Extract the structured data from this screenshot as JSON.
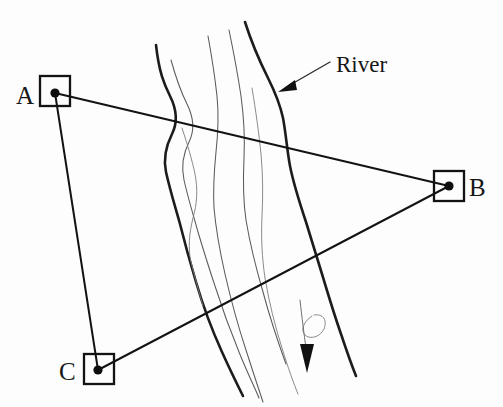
{
  "figure": {
    "type": "surveying-diagram",
    "background_color": "#fdfdfd",
    "ink_color": "#131313",
    "width": 503,
    "height": 407
  },
  "stations": [
    {
      "id": "A",
      "label": "A",
      "label_x": 16,
      "label_y": 104,
      "point_x": 55,
      "point_y": 93,
      "box_x": 40,
      "box_y": 76,
      "box_w": 30,
      "box_h": 30
    },
    {
      "id": "B",
      "label": "B",
      "label_x": 469,
      "label_y": 196,
      "point_x": 449,
      "point_y": 186,
      "box_x": 434,
      "box_y": 171,
      "box_w": 30,
      "box_h": 30
    },
    {
      "id": "C",
      "label": "C",
      "label_x": 59,
      "label_y": 380,
      "point_x": 98,
      "point_y": 370,
      "box_x": 84,
      "box_y": 354,
      "box_w": 30,
      "box_h": 30
    }
  ],
  "sight_lines": [
    {
      "name": "line-a-b",
      "from": "A",
      "to": "B"
    },
    {
      "name": "line-a-c",
      "from": "A",
      "to": "C"
    },
    {
      "name": "line-c-b",
      "from": "C",
      "to": "B"
    }
  ],
  "annotations": {
    "river_label": "River",
    "river_leader_from_x": 330,
    "river_leader_from_y": 62,
    "river_leader_to_x": 279,
    "river_leader_to_y": 92
  },
  "river": {
    "flow_direction": "downstream-south",
    "left_bank_path": "M 156 45 C 159 72, 164 84, 170 96 C 177 110, 178 122, 172 134 C 166 146, 163 158, 166 172 C 170 190, 175 206, 180 224 C 185 244, 190 262, 196 282 C 203 306, 212 330, 222 352 C 231 372, 238 386, 243 396",
    "right_bank_path": "M 245 22 C 252 44, 260 62, 268 78 C 275 92, 280 104, 283 118 C 286 134, 287 150, 290 166 C 294 186, 300 204, 306 222 C 312 242, 317 258, 322 274 C 328 294, 334 314, 341 334 C 347 352, 352 366, 356 376",
    "inner_lines": [
      "M 171 60 C 176 78, 181 92, 187 104 C 194 118, 195 130, 189 142 C 183 154, 181 166, 184 180 C 188 198, 193 214, 198 232 C 204 252, 209 268, 215 286 C 222 308, 230 330, 239 352 C 247 372, 254 386, 259 398",
      "M 182 128 C 188 146, 192 160, 195 174 C 198 190, 197 204, 193 218 C 189 234, 188 248, 191 262 C 195 278, 199 292, 203 306",
      "M 208 36 C 212 58, 215 78, 217 96 C 219 116, 218 134, 216 152 C 214 172, 213 190, 214 208 C 216 230, 220 252, 225 274 C 231 300, 238 326, 246 350 C 253 372, 259 390, 263 402",
      "M 229 30 C 234 54, 238 76, 241 96 C 244 118, 245 138, 244 158 C 243 180, 243 200, 246 220 C 250 244, 256 268, 263 292 C 270 318, 278 342, 286 364",
      "M 252 88 C 256 112, 259 134, 261 154 C 263 176, 263 196, 262 216 C 261 238, 262 258, 265 278 C 269 302, 275 326, 282 348 C 288 368, 294 384, 298 394"
    ],
    "eddy_path": "M 312 316 C 306 320, 302 326, 303 331 C 304 337, 311 339, 317 336 C 323 333, 326 327, 325 321 C 324 316, 319 314, 314 315",
    "flow_arrow_stem": "M 300 300 C 302 318, 304 334, 306 348",
    "flow_arrow_tip_x": 307,
    "flow_arrow_tip_y": 372
  }
}
